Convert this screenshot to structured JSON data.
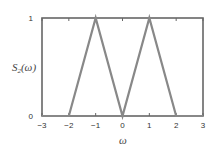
{
  "chart_data": {
    "type": "line",
    "title": "",
    "xlabel": "ω",
    "ylabel_main": "S",
    "ylabel_sub": "2",
    "ylabel_arg": "(ω)",
    "xlim": [
      -3,
      3
    ],
    "ylim": [
      0,
      1
    ],
    "xticks": [
      -3,
      -2,
      -1,
      0,
      1,
      2,
      3
    ],
    "xtick_labels": [
      "−3",
      "−2",
      "−1",
      "0",
      "1",
      "2",
      "3"
    ],
    "yticks": [
      0,
      1
    ],
    "ytick_labels": [
      "0",
      "1"
    ],
    "grid": false,
    "series": [
      {
        "name": "S2(ω)",
        "x": [
          -3,
          -2,
          -1,
          0,
          1,
          2,
          3
        ],
        "y": [
          0,
          0,
          1,
          0,
          1,
          0,
          0
        ]
      }
    ],
    "colors": {
      "line": "#888888",
      "frame": "#666666",
      "text": "#333333"
    }
  }
}
